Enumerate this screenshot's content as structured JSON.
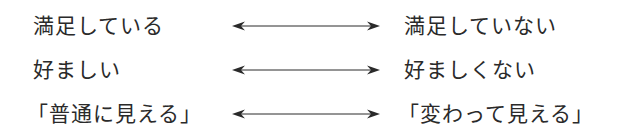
{
  "diagram": {
    "type": "bipolar-scale-pairs",
    "arrow_style": "double-headed",
    "colors": {
      "text": "#2a2a2a",
      "arrow": "#2a2a2a",
      "background": "#ffffff"
    },
    "pairs": [
      {
        "left": "満足している",
        "right": "満足していない"
      },
      {
        "left": "好ましい",
        "right": "好ましくない"
      },
      {
        "left": "「普通に見える」",
        "right": "「変わって見える」"
      }
    ]
  }
}
